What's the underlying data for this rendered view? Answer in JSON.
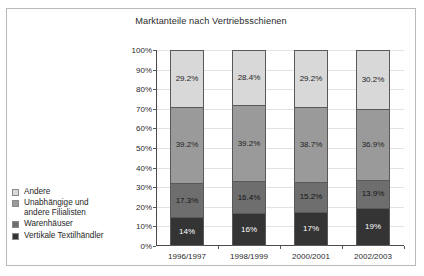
{
  "chart_data": {
    "type": "bar",
    "subtype": "stacked-100-percent",
    "title": "Marktanteile nach Vertriebsschienen",
    "xlabel": "",
    "ylabel": "",
    "ylim": [
      0,
      100
    ],
    "ytick_labels": [
      "0%",
      "10%",
      "20%",
      "30%",
      "40%",
      "50%",
      "60%",
      "70%",
      "80%",
      "90%",
      "100%"
    ],
    "ytick_values": [
      0,
      10,
      20,
      30,
      40,
      50,
      60,
      70,
      80,
      90,
      100
    ],
    "grid": true,
    "legend_position": "left",
    "categories": [
      "1996/1997",
      "1998/1999",
      "2000/2001",
      "2002/2003"
    ],
    "series": [
      {
        "name": "Andere",
        "color": "#d8d8d8",
        "values": [
          29.2,
          28.4,
          29.2,
          30.2
        ],
        "labels": [
          "29.2%",
          "28.4%",
          "29.2%",
          "30.2%"
        ],
        "label_color": "#1f1f1f"
      },
      {
        "name": "Unabhängige und\nandere Filialisten",
        "color": "#9a9a9a",
        "values": [
          39.2,
          39.2,
          38.7,
          36.9
        ],
        "labels": [
          "39.2%",
          "39.2%",
          "38.7%",
          "36.9%"
        ],
        "label_color": "#1f1f1f"
      },
      {
        "name": "Warenhäuser",
        "color": "#6e6e6e",
        "values": [
          17.3,
          16.4,
          15.2,
          13.9
        ],
        "labels": [
          "17.3%",
          "16.4%",
          "15.2%",
          "13.9%"
        ],
        "label_color": "#141414"
      },
      {
        "name": "Vertikale Textilhändler",
        "color": "#343434",
        "values": [
          14,
          16,
          17,
          19
        ],
        "labels": [
          "14%",
          "16%",
          "17%",
          "19%"
        ],
        "label_color": "#ffffff"
      }
    ]
  },
  "legend": {
    "items": [
      {
        "label": "Andere",
        "color": "#d8d8d8"
      },
      {
        "label": "Unabhängige und\nandere Filialisten",
        "color": "#9a9a9a"
      },
      {
        "label": "Warenhäuser",
        "color": "#6e6e6e"
      },
      {
        "label": "Vertikale Textilhändler",
        "color": "#343434"
      }
    ]
  }
}
